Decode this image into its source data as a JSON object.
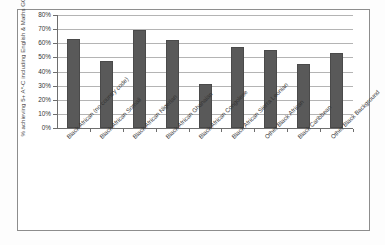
{
  "chart_data": {
    "type": "bar",
    "title": "",
    "subtitle": "",
    "xlabel": "",
    "ylabel": "% achieving 5+ A*-C including English & Maths GCSE",
    "ylim": [
      0,
      80
    ],
    "ytick_labels": [
      "80%",
      "70%",
      "60%",
      "50%",
      "40%",
      "30%",
      "20%",
      "10%",
      "0%"
    ],
    "ytick_values": [
      80,
      70,
      60,
      50,
      40,
      30,
      20,
      10,
      0
    ],
    "grid": true,
    "legend": "none",
    "bar_color": "#595959",
    "categories": [
      "Black African (no country code)",
      "Black African Somali",
      "Black African Nigerian",
      "Black African Ghanaian",
      "Black African Congolese",
      "Black African Sierra Leonian",
      "Other Black African",
      "Black Caribbean",
      "Other Black Background"
    ],
    "values": [
      63,
      47.5,
      69.5,
      62,
      31,
      57.5,
      55.5,
      45,
      53
    ]
  },
  "figure": {
    "background_color": "#ffffff",
    "frame_color": "#8d8d8d",
    "gridline_color": "#b4b4b4",
    "axis_color": "#6e6e6e"
  }
}
